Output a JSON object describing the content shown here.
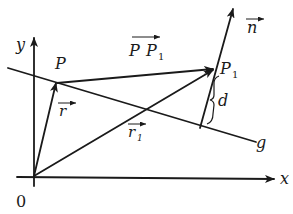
{
  "diagram": {
    "title": "",
    "axes": {
      "x_label": "x",
      "y_label": "y",
      "origin_label": "0"
    },
    "points": {
      "P": "P",
      "P1_main": "P",
      "P1_sub": "1"
    },
    "line_label": "g",
    "vectors": {
      "r": "r",
      "r1_main": "r",
      "r1_sub": "1",
      "PP1_a": "P",
      "PP1_b": "P",
      "PP1_sub": "1",
      "n": "n"
    },
    "distance_label": "d",
    "colors": {
      "ink": "#1a1a1a",
      "background": "#ffffff"
    }
  }
}
